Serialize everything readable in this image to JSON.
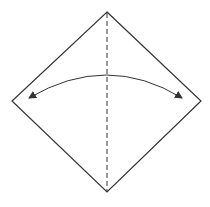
{
  "diagram": {
    "type": "origami-step",
    "colors": {
      "background": "#ffffff",
      "stroke": "#333333"
    },
    "shape": {
      "vertices": {
        "top": [
          107,
          12
        ],
        "right": [
          201,
          101
        ],
        "bottom": [
          107,
          192
        ],
        "left": [
          12,
          101
        ]
      }
    },
    "fold_line": {
      "style": "dashed",
      "from": [
        107,
        12
      ],
      "to": [
        107,
        192
      ]
    },
    "arrow": {
      "type": "curved-double-headed",
      "start": [
        29,
        98
      ],
      "control": [
        107,
        52
      ],
      "end": [
        182,
        98
      ]
    }
  }
}
